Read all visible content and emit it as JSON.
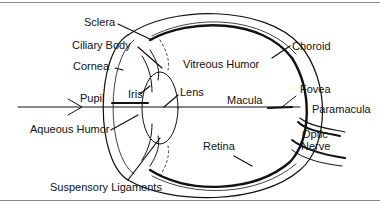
{
  "diagram": {
    "labels": {
      "sclera": "Sclera",
      "ciliary_body": "Ciliary Body",
      "cornea": "Cornea",
      "pupil": "Pupil",
      "iris": "Iris",
      "lens": "Lens",
      "aqueous_humor": "Aqueous Humor",
      "suspensory_ligaments": "Suspensory Ligaments",
      "vitreous_humor": "Vitreous Humor",
      "choroid": "Choroid",
      "fovea": "Fovea",
      "macula": "Macula",
      "paramacula": "Paramacula",
      "optic": "Optic",
      "nerve": "Nerve",
      "retina": "Retina"
    },
    "colors": {
      "line": "#111111",
      "rule": "#8a8a8a",
      "background": "#ffffff"
    }
  }
}
